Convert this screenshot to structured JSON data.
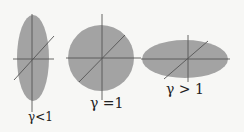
{
  "diagram": {
    "fill_color": "#a3a3a3",
    "line_color": "#555555",
    "shapes": [
      {
        "kind": "tall-ellipse",
        "label": "γ<1"
      },
      {
        "kind": "circle",
        "label": "γ =1"
      },
      {
        "kind": "wide-ellipse",
        "label": "γ > 1"
      }
    ]
  }
}
